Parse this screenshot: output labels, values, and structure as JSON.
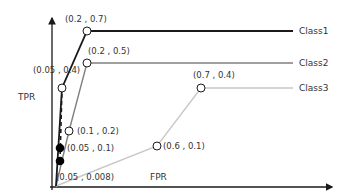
{
  "chart_data": {
    "type": "line",
    "title": "",
    "xlabel": "FPR",
    "ylabel": "TPR",
    "grid": false,
    "legend_placement": "right (inline labels at line ends)",
    "series": [
      {
        "name": "Class1",
        "color": "#1a1a1a",
        "points": [
          {
            "x": 0,
            "y": 0,
            "label": ""
          },
          {
            "x": 0.05,
            "y": 0.4,
            "label": "(0.05 , 0.4)"
          },
          {
            "x": 0.2,
            "y": 0.7,
            "label": "(0.2 , 0.7)"
          }
        ]
      },
      {
        "name": "Class2",
        "color": "#808080",
        "points": [
          {
            "x": 0,
            "y": 0,
            "label": ""
          },
          {
            "x": 0.1,
            "y": 0.2,
            "label": "(0.1 , 0.2)"
          },
          {
            "x": 0.2,
            "y": 0.5,
            "label": "(0.2 , 0.5)"
          }
        ]
      },
      {
        "name": "Class3",
        "color": "#c8c8c8",
        "points": [
          {
            "x": 0,
            "y": 0,
            "label": ""
          },
          {
            "x": 0.6,
            "y": 0.1,
            "label": "(0.6 , 0.1)"
          },
          {
            "x": 0.7,
            "y": 0.4,
            "label": "(0.7 , 0.4)"
          }
        ]
      }
    ],
    "highlighted_points": [
      {
        "x": 0.05,
        "y": 0.1,
        "label": "(0.05 , 0.1)",
        "style": "filled"
      },
      {
        "x": 0.05,
        "y": 0.008,
        "label": "(0.05 , 0.008)",
        "style": "filled"
      }
    ],
    "dashed_line": {
      "from": {
        "x": 0.05,
        "y": 0.008
      },
      "to": {
        "x": 0.05,
        "y": 0.4
      },
      "color": "#1a1a1a"
    }
  }
}
